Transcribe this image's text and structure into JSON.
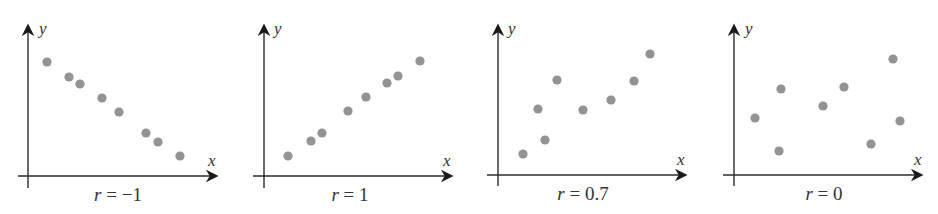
{
  "chart_data": [
    {
      "type": "scatter",
      "title": "r = −1",
      "xlabel": "x",
      "ylabel": "y",
      "r_value": "−1",
      "grid": false,
      "points_px": [
        [
          47,
          62
        ],
        [
          69,
          77
        ],
        [
          80,
          84
        ],
        [
          102,
          98
        ],
        [
          119,
          112
        ],
        [
          146,
          133
        ],
        [
          158,
          142
        ],
        [
          180,
          156
        ]
      ],
      "origin_px": [
        28,
        176
      ],
      "x": [
        19,
        41,
        52,
        74,
        91,
        118,
        130,
        152
      ],
      "y": [
        114,
        99,
        92,
        78,
        64,
        43,
        34,
        20
      ]
    },
    {
      "type": "scatter",
      "title": "r = 1",
      "xlabel": "x",
      "ylabel": "y",
      "r_value": "1",
      "grid": false,
      "points_px": [
        [
          288,
          156
        ],
        [
          311,
          141
        ],
        [
          322,
          133
        ],
        [
          348,
          111
        ],
        [
          366,
          97
        ],
        [
          387,
          83
        ],
        [
          398,
          76
        ],
        [
          420,
          61
        ]
      ],
      "origin_px": [
        264,
        176
      ],
      "x": [
        24,
        47,
        58,
        84,
        102,
        123,
        134,
        156
      ],
      "y": [
        20,
        35,
        43,
        65,
        79,
        93,
        100,
        115
      ]
    },
    {
      "type": "scatter",
      "title": "r = 0.7",
      "xlabel": "x",
      "ylabel": "y",
      "r_value": "0.7",
      "grid": false,
      "points_px": [
        [
          523,
          154
        ],
        [
          538,
          109
        ],
        [
          545,
          140
        ],
        [
          557,
          80
        ],
        [
          583,
          110
        ],
        [
          611,
          100
        ],
        [
          634,
          81
        ],
        [
          650,
          54
        ]
      ],
      "origin_px": [
        498,
        176
      ],
      "x": [
        25,
        40,
        47,
        59,
        85,
        113,
        136,
        152
      ],
      "y": [
        22,
        67,
        36,
        96,
        66,
        76,
        95,
        122
      ]
    },
    {
      "type": "scatter",
      "title": "r = 0",
      "xlabel": "x",
      "ylabel": "y",
      "r_value": "0",
      "grid": false,
      "points_px": [
        [
          755,
          118
        ],
        [
          779,
          151
        ],
        [
          781,
          89
        ],
        [
          823,
          106
        ],
        [
          844,
          87
        ],
        [
          871,
          144
        ],
        [
          893,
          59
        ],
        [
          900,
          121
        ]
      ],
      "origin_px": [
        734,
        176
      ],
      "x": [
        21,
        45,
        47,
        89,
        110,
        137,
        159,
        166
      ],
      "y": [
        58,
        25,
        87,
        70,
        89,
        32,
        117,
        55
      ]
    }
  ],
  "panels": [
    {
      "y_label": "y",
      "x_label": "x",
      "r_prefix": "r",
      "r_eq": " = ",
      "r_val": "−1"
    },
    {
      "y_label": "y",
      "x_label": "x",
      "r_prefix": "r",
      "r_eq": " = ",
      "r_val": "1"
    },
    {
      "y_label": "y",
      "x_label": "x",
      "r_prefix": "r",
      "r_eq": " = ",
      "r_val": "0.7"
    },
    {
      "y_label": "y",
      "x_label": "x",
      "r_prefix": "r",
      "r_eq": " = ",
      "r_val": "0"
    }
  ],
  "colors": {
    "dot": "#939393",
    "axis": "#2b2b2b"
  }
}
